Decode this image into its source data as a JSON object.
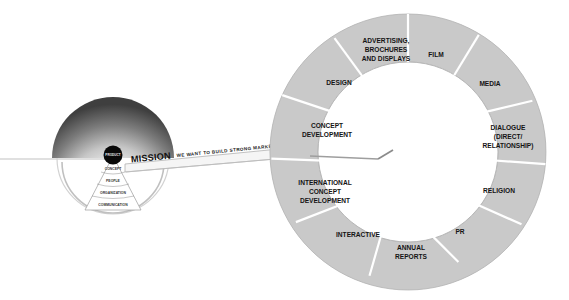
{
  "canvas": {
    "width": 569,
    "height": 300,
    "background": "#ffffff"
  },
  "colors": {
    "segment_fill": "#c9c9c9",
    "segment_divider": "#ffffff",
    "ring_outline": "#b0b0b0",
    "label_text": "#141414",
    "dome_dark": "#4a4a4a",
    "dome_light": "#fdfdfd",
    "product_dot": "#0a0a0a",
    "connector_fill": "#f2f2f2",
    "connector_stroke": "#9a9a9a",
    "line": "#b9b9b9"
  },
  "mission": {
    "keyword": "MISSION",
    "statement": "WE WANT TO BUILD STRONG MARKET POSITIONS"
  },
  "product_circle": {
    "label": "PRODUCT"
  },
  "pyramid": {
    "layers": [
      {
        "label": "CONCEPT"
      },
      {
        "label": "PEOPLE"
      },
      {
        "label": "ORGANIZATION"
      },
      {
        "label": "COMMUNICATION"
      }
    ]
  },
  "wheel": {
    "title": "Communication disciplines wheel",
    "center_hole": "empty",
    "segments": [
      {
        "id": "film",
        "label": "FILM",
        "lines": [
          "FILM"
        ]
      },
      {
        "id": "media",
        "label": "MEDIA",
        "lines": [
          "MEDIA"
        ]
      },
      {
        "id": "dialogue",
        "label": "DIALOGUE (DIRECT/RELATIONSHIP)",
        "lines": [
          "DIALOGUE",
          "(DIRECT/",
          "RELATIONSHIP)"
        ]
      },
      {
        "id": "religion",
        "label": "RELIGION",
        "lines": [
          "RELIGION"
        ]
      },
      {
        "id": "pr",
        "label": "PR",
        "lines": [
          "PR"
        ]
      },
      {
        "id": "annual-reports",
        "label": "ANNUAL REPORTS",
        "lines": [
          "ANNUAL",
          "REPORTS"
        ]
      },
      {
        "id": "interactive",
        "label": "INTERACTIVE",
        "lines": [
          "INTERACTIVE"
        ]
      },
      {
        "id": "international-concept-development",
        "label": "INTERNATIONAL CONCEPT DEVELOPMENT",
        "lines": [
          "INTERNATIONAL",
          "CONCEPT",
          "DEVELOPMENT"
        ]
      },
      {
        "id": "concept-development",
        "label": "CONCEPT DEVELOPMENT",
        "lines": [
          "CONCEPT",
          "DEVELOPMENT"
        ]
      },
      {
        "id": "design",
        "label": "DESIGN",
        "lines": [
          "DESIGN"
        ]
      },
      {
        "id": "advertising-brochures-displays",
        "label": "ADVERTISING, BROCHURES AND DISPLAYS",
        "lines": [
          "ADVERTISING,",
          "BROCHURES",
          "AND DISPLAYS"
        ]
      }
    ]
  }
}
